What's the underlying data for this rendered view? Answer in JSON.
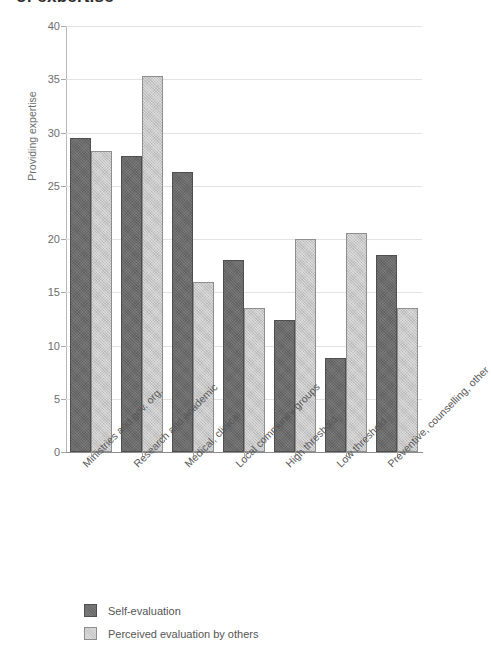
{
  "title": "of expertise",
  "chart_data": {
    "type": "bar",
    "title": "of expertise",
    "xlabel": "",
    "ylabel": "Providing expertise",
    "ylim": [
      0,
      40
    ],
    "yticks": [
      0,
      5,
      10,
      15,
      20,
      25,
      30,
      35,
      40
    ],
    "grid": true,
    "legend_position": "bottom-left",
    "categories": [
      "Ministries and gov. org.",
      "Research and academic",
      "Medical, clinical",
      "Local community groups",
      "High threshold",
      "Low threshold",
      "Preventive, counselling, other"
    ],
    "series": [
      {
        "name": "Self-evaluation",
        "color": "#6b6b6b",
        "values": [
          29.5,
          27.8,
          26.3,
          18.0,
          12.4,
          8.8,
          18.5
        ]
      },
      {
        "name": "Perceived evaluation by others",
        "color": "#c8c8c8",
        "values": [
          28.3,
          35.3,
          16.0,
          13.5,
          20.0,
          20.6,
          13.5
        ]
      }
    ]
  },
  "legend": {
    "items": [
      {
        "label": "Self-evaluation",
        "swatch": "dark"
      },
      {
        "label": "Perceived evaluation by others",
        "swatch": "light"
      }
    ]
  }
}
